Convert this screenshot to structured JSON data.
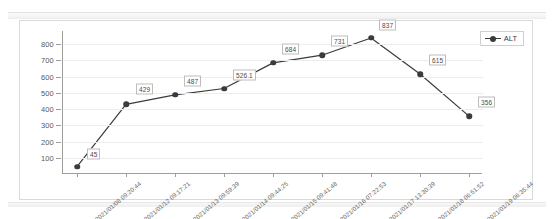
{
  "chart_data": {
    "type": "line",
    "title": "",
    "xlabel": "",
    "ylabel": "",
    "ylim": [
      0,
      880
    ],
    "yticks": [
      100,
      200,
      300,
      400,
      500,
      600,
      700,
      800
    ],
    "grid": true,
    "legend_position": "top-right",
    "categories": [
      "2021/01/08 09:20:44",
      "2021/01/12 09:17:21",
      "2021/01/13 09:59:39",
      "2021/01/14 09:44:25",
      "2021/01/15 09:41:48",
      "2021/01/16 07:22:53",
      "2021/01/17 13:30:39",
      "2021/01/18 06:51:52",
      "2021/01/19 06:35:44"
    ],
    "series": [
      {
        "name": "ALT",
        "color": "#3b3b3b",
        "marker": "circle",
        "values": [
          45,
          429,
          487,
          526.1,
          684,
          731,
          837,
          615,
          356
        ],
        "point_labels": [
          "45",
          "429",
          "487",
          "526.1",
          "684",
          "731",
          "837",
          "615",
          "356"
        ]
      }
    ]
  },
  "legend": {
    "items": [
      {
        "label": "ALT"
      }
    ]
  },
  "axis": {
    "y_tick_labels": [
      "800",
      "700",
      "600",
      "500",
      "400",
      "300",
      "200",
      "100"
    ],
    "x_tick_labels": [
      "2021/01/08 09:20:44",
      "2021/01/12 09:17:21",
      "2021/01/13 09:59:39",
      "2021/01/14 09:44:25",
      "2021/01/15 09:41:48",
      "2021/01/16 07:22:53",
      "2021/01/17 13:30:39",
      "2021/01/18 06:51:52",
      "2021/01/19 06:35:44"
    ]
  }
}
